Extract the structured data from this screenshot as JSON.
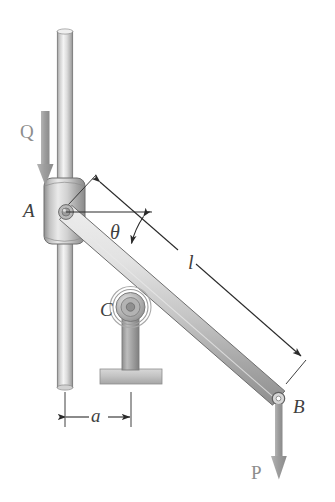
{
  "figure": {
    "type": "engineering-mechanics-diagram",
    "background_color": "#ffffff",
    "width": 335,
    "height": 502,
    "labels": {
      "point_a": "A",
      "point_b": "B",
      "point_c": "C",
      "force_q": "Q",
      "force_p": "P",
      "angle_theta": "θ",
      "length_l": "l",
      "distance_a": "a"
    },
    "colors": {
      "metal_light": "#f2f2f2",
      "metal_mid": "#c9c9c9",
      "metal_dark": "#9a9a9a",
      "metal_edge": "#6f6f6f",
      "arrow_gray": "#a0a0a0",
      "leader_black": "#2a2a2a",
      "label_gray": "#4a4a4a"
    },
    "components": {
      "vertical_rod": "vertical-guide-rod",
      "collar": "sliding-collar-at-a",
      "pin_joint": "pin-at-a",
      "bar": "rigid-bar-ab",
      "roller": "roller-support-c",
      "roller_post": "roller-post",
      "roller_base": "roller-base-plate",
      "pin_b": "pin-at-b"
    },
    "annotations": {
      "length_dimension": "l",
      "offset_dimension": "a",
      "angle_reference": "horizontal reference at A"
    }
  }
}
